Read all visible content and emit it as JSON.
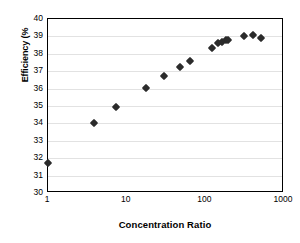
{
  "chart_data": {
    "type": "scatter",
    "title": "",
    "xlabel": "Concentration Ratio",
    "ylabel": "Efficiency (%",
    "xscale": "log",
    "yscale": "linear",
    "xlim": [
      1,
      1000
    ],
    "ylim": [
      30,
      40
    ],
    "grid": true,
    "legend": null,
    "marker": "diamond",
    "marker_color": "#2b2b2b",
    "xticks": [
      1,
      10,
      100,
      1000
    ],
    "xtick_labels": [
      "1",
      "10",
      "100",
      "1000"
    ],
    "yticks": [
      30,
      31,
      32,
      33,
      34,
      35,
      36,
      37,
      38,
      39,
      40
    ],
    "ytick_labels": [
      "30",
      "31",
      "32",
      "33",
      "34",
      "35",
      "36",
      "37",
      "38",
      "39",
      "40"
    ],
    "points": [
      {
        "x": 1,
        "y": 31.7
      },
      {
        "x": 3.9,
        "y": 34.0
      },
      {
        "x": 7.4,
        "y": 34.95
      },
      {
        "x": 17.5,
        "y": 36.05
      },
      {
        "x": 30,
        "y": 36.75
      },
      {
        "x": 48,
        "y": 37.25
      },
      {
        "x": 63,
        "y": 37.6
      },
      {
        "x": 120,
        "y": 38.35
      },
      {
        "x": 145,
        "y": 38.6
      },
      {
        "x": 165,
        "y": 38.7
      },
      {
        "x": 185,
        "y": 38.78
      },
      {
        "x": 195,
        "y": 38.8
      },
      {
        "x": 310,
        "y": 39.05
      },
      {
        "x": 400,
        "y": 39.1
      },
      {
        "x": 510,
        "y": 38.92
      }
    ]
  }
}
